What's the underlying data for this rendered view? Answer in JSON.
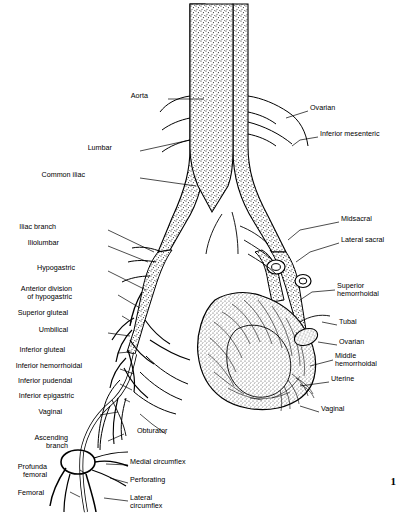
{
  "figure": {
    "page_number": "1",
    "labels": [
      {
        "id": "aorta",
        "text": "Aorta",
        "x": 148,
        "y": 96,
        "align": "right"
      },
      {
        "id": "ovarian-left",
        "text": "Ovarian",
        "x": 310,
        "y": 108,
        "align": "left"
      },
      {
        "id": "inferior-mesenteric",
        "text": "Inferior mesenteric",
        "x": 320,
        "y": 134,
        "align": "left"
      },
      {
        "id": "lumbar",
        "text": "Lumbar",
        "x": 112,
        "y": 148,
        "align": "right"
      },
      {
        "id": "common-iliac",
        "text": "Common iliac",
        "x": 85,
        "y": 175,
        "align": "right"
      },
      {
        "id": "midsacral",
        "text": "Midsacral",
        "x": 341,
        "y": 219,
        "align": "left"
      },
      {
        "id": "iliac-branch",
        "text": "Iliac branch",
        "x": 56,
        "y": 227,
        "align": "right"
      },
      {
        "id": "iliolumbar",
        "text": "Iliolumbar",
        "x": 59,
        "y": 243,
        "align": "right"
      },
      {
        "id": "lateral-sacral",
        "text": "Lateral sacral",
        "x": 341,
        "y": 240,
        "align": "left"
      },
      {
        "id": "hypogastric",
        "text": "Hypogastric",
        "x": 75,
        "y": 268,
        "align": "right"
      },
      {
        "id": "anterior-division",
        "text": "Anterior division\nof hypogastric",
        "x": 72,
        "y": 289,
        "align": "right"
      },
      {
        "id": "superior-hemorrhoidal",
        "text": "Superior\nhemorrhoidal",
        "x": 337,
        "y": 286,
        "align": "left"
      },
      {
        "id": "superior-gluteal",
        "text": "Superior gluteal",
        "x": 68,
        "y": 313,
        "align": "right"
      },
      {
        "id": "tubal",
        "text": "Tubal",
        "x": 339,
        "y": 322,
        "align": "left"
      },
      {
        "id": "umbilical",
        "text": "Umbilical",
        "x": 68,
        "y": 330,
        "align": "right"
      },
      {
        "id": "ovarian-right",
        "text": "Ovarian",
        "x": 339,
        "y": 342,
        "align": "left"
      },
      {
        "id": "inferior-gluteal",
        "text": "Inferior gluteal",
        "x": 65,
        "y": 350,
        "align": "right"
      },
      {
        "id": "middle-hemorrhoidal",
        "text": "Middle\nhemorrhoidal",
        "x": 335,
        "y": 356,
        "align": "left"
      },
      {
        "id": "inferior-hemorrhoidal",
        "text": "Inferior hemorrhoidal",
        "x": 82,
        "y": 366,
        "align": "right"
      },
      {
        "id": "uterine",
        "text": "Uterine",
        "x": 331,
        "y": 379,
        "align": "left"
      },
      {
        "id": "inferior-pudendal",
        "text": "Inferior pudendal",
        "x": 72,
        "y": 381,
        "align": "right"
      },
      {
        "id": "inferior-epigastric",
        "text": "Inferior epigastric",
        "x": 74,
        "y": 396,
        "align": "right"
      },
      {
        "id": "vaginal-left",
        "text": "Vaginal",
        "x": 62,
        "y": 412,
        "align": "right"
      },
      {
        "id": "vaginal-right",
        "text": "Vaginal",
        "x": 321,
        "y": 409,
        "align": "left"
      },
      {
        "id": "obturator",
        "text": "Obturator",
        "x": 137,
        "y": 431,
        "align": "left"
      },
      {
        "id": "ascending-branch",
        "text": "Ascending\nbranch",
        "x": 68,
        "y": 438,
        "align": "right"
      },
      {
        "id": "medial-circumflex",
        "text": "Medial circumflex",
        "x": 130,
        "y": 462,
        "align": "left"
      },
      {
        "id": "profunda-femoral",
        "text": "Profunda\nfemoral",
        "x": 47,
        "y": 467,
        "align": "right"
      },
      {
        "id": "perforating",
        "text": "Perforating",
        "x": 130,
        "y": 480,
        "align": "left"
      },
      {
        "id": "femoral",
        "text": "Femoral",
        "x": 130,
        "y": 498,
        "align": "left"
      },
      {
        "id": "lateral-circumflex",
        "text": "Lateral\ncircumflex",
        "x": 44,
        "y": 493,
        "align": "right"
      }
    ],
    "colors": {
      "ink": "#000000",
      "background": "#ffffff",
      "stipple": "#222222"
    }
  }
}
